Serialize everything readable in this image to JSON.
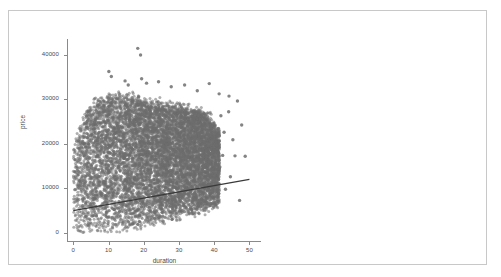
{
  "chart_data": {
    "type": "scatter",
    "title": "",
    "xlabel": "duration",
    "ylabel": "price",
    "xlim": [
      -1.5,
      53
    ],
    "ylim": [
      -1800,
      43500
    ],
    "xticks": [
      0,
      10,
      20,
      30,
      40,
      50
    ],
    "xtick_labels": [
      "0",
      "10",
      "20",
      "30",
      "40",
      "50"
    ],
    "yticks": [
      0,
      10000,
      20000,
      30000,
      40000
    ],
    "ytick_labels": [
      "0",
      "10000",
      "20000",
      "30000",
      "40000"
    ],
    "grid": false,
    "legend": null,
    "marker": {
      "shape": "circle",
      "color": "#6e6e6e",
      "size_px": 3,
      "opacity": 0.55
    },
    "point_color": "#6e6e6e",
    "dense_core_color": "#6e6e6e",
    "axis_color": "#8a8a8a",
    "label_color": "#4a4a4a",
    "frame_color": "#c8c8c8",
    "background": "#ffffff",
    "series": [
      {
        "name": "price vs duration",
        "n_points_approx": 40000,
        "description": "Very dense overplotted cloud of listings; solid saturated mass for duration 0-40 and price 0-25000, thinning upward to ~41000 and rightward to duration ~50.",
        "cloud": {
          "x_range": [
            0,
            50
          ],
          "y_range": [
            0,
            41500
          ],
          "core_x_range": [
            0,
            40
          ],
          "core_y_range": [
            0,
            25000
          ],
          "lower_edge_x": [
            0,
            5,
            10,
            15,
            20,
            25,
            30,
            35,
            38,
            40,
            41
          ],
          "lower_edge_y": [
            300,
            300,
            500,
            900,
            1400,
            2200,
            3200,
            4400,
            5200,
            5600,
            6200
          ],
          "upper_edge_x": [
            0,
            2,
            5,
            8,
            10,
            13,
            16,
            20,
            24,
            28,
            32,
            36,
            39,
            41
          ],
          "upper_edge_y": [
            19000,
            24500,
            28500,
            30000,
            30500,
            31000,
            30500,
            29500,
            29000,
            28500,
            28000,
            27000,
            25500,
            23000
          ]
        },
        "outliers": [
          {
            "x": 18.3,
            "y": 41400
          },
          {
            "x": 19.1,
            "y": 39900
          },
          {
            "x": 10.1,
            "y": 36200
          },
          {
            "x": 10.8,
            "y": 35100
          },
          {
            "x": 14.7,
            "y": 34100
          },
          {
            "x": 15.6,
            "y": 33200
          },
          {
            "x": 19.4,
            "y": 34600
          },
          {
            "x": 20.8,
            "y": 33600
          },
          {
            "x": 24.2,
            "y": 33900
          },
          {
            "x": 27.8,
            "y": 32800
          },
          {
            "x": 31.6,
            "y": 33200
          },
          {
            "x": 35.2,
            "y": 31900
          },
          {
            "x": 38.6,
            "y": 33500
          },
          {
            "x": 41.4,
            "y": 31200
          },
          {
            "x": 44.2,
            "y": 30700
          },
          {
            "x": 46.6,
            "y": 29600
          },
          {
            "x": 44.1,
            "y": 27200
          },
          {
            "x": 41.9,
            "y": 26300
          },
          {
            "x": 47.8,
            "y": 24200
          },
          {
            "x": 42.8,
            "y": 22600
          },
          {
            "x": 45.3,
            "y": 20900
          },
          {
            "x": 42.4,
            "y": 17400
          },
          {
            "x": 45.9,
            "y": 17300
          },
          {
            "x": 48.8,
            "y": 17200
          },
          {
            "x": 44.6,
            "y": 12600
          },
          {
            "x": 47.2,
            "y": 7300
          },
          {
            "x": 41.6,
            "y": 14800
          },
          {
            "x": 43.2,
            "y": 9800
          }
        ]
      }
    ],
    "trendline": {
      "type": "linear",
      "color": "#3a3a3a",
      "width_px": 1.2,
      "x_start": 0,
      "y_start": 5000,
      "x_end": 50,
      "y_end": 12000,
      "slope": 140,
      "intercept": 5000
    }
  }
}
